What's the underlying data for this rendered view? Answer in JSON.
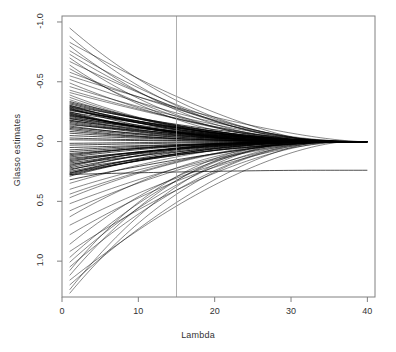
{
  "chart_data": {
    "type": "line",
    "title": "",
    "subtitle": "",
    "xlabel": "Lambda",
    "ylabel": "Glasso estimates",
    "xlim": [
      0,
      41
    ],
    "ylim": [
      1.3,
      -1.05
    ],
    "y_axis_inverted": true,
    "grid": false,
    "legend": null,
    "xticks": [
      {
        "value": 0,
        "label": "0"
      },
      {
        "value": 10,
        "label": "10"
      },
      {
        "value": 20,
        "label": "20"
      },
      {
        "value": 30,
        "label": "30"
      },
      {
        "value": 40,
        "label": "40"
      }
    ],
    "yticks": [
      {
        "value": -1.0,
        "label": "-1.0"
      },
      {
        "value": -0.5,
        "label": "-0.5"
      },
      {
        "value": 0.0,
        "label": "0.0"
      },
      {
        "value": 0.5,
        "label": "0.5"
      },
      {
        "value": 1.0,
        "label": "1.0"
      }
    ],
    "annotations": [
      {
        "name": "selected-lambda-line",
        "type": "vline",
        "x": 15
      }
    ],
    "series_count": 108,
    "x_start": 1,
    "x_end": 40,
    "converge_x": 36,
    "series": [
      {
        "name": "path-001",
        "y0": -0.95,
        "yend": 0.0
      },
      {
        "name": "path-002",
        "y0": -0.88,
        "yend": 0.0
      },
      {
        "name": "path-003",
        "y0": -0.83,
        "yend": 0.0
      },
      {
        "name": "path-004",
        "y0": -0.8,
        "yend": 0.0
      },
      {
        "name": "path-005",
        "y0": -0.76,
        "yend": 0.0
      },
      {
        "name": "path-006",
        "y0": -0.73,
        "yend": 0.0
      },
      {
        "name": "path-007",
        "y0": -0.7,
        "yend": 0.0
      },
      {
        "name": "path-008",
        "y0": -0.67,
        "yend": 0.0
      },
      {
        "name": "path-009",
        "y0": -0.64,
        "yend": 0.0
      },
      {
        "name": "path-010",
        "y0": -0.61,
        "yend": 0.0
      },
      {
        "name": "path-011",
        "y0": -0.58,
        "yend": 0.0
      },
      {
        "name": "path-012",
        "y0": -0.55,
        "yend": 0.0
      },
      {
        "name": "path-013",
        "y0": -0.52,
        "yend": 0.0
      },
      {
        "name": "path-014",
        "y0": -0.49,
        "yend": 0.0
      },
      {
        "name": "path-015",
        "y0": -0.46,
        "yend": 0.0
      },
      {
        "name": "path-016",
        "y0": -0.43,
        "yend": 0.0
      },
      {
        "name": "path-017",
        "y0": -0.41,
        "yend": 0.0
      },
      {
        "name": "path-018",
        "y0": -0.39,
        "yend": 0.0
      },
      {
        "name": "path-019",
        "y0": -0.37,
        "yend": 0.0
      },
      {
        "name": "path-020",
        "y0": -0.35,
        "yend": 0.0
      },
      {
        "name": "path-021",
        "y0": -0.335,
        "yend": 0.0
      },
      {
        "name": "path-022",
        "y0": -0.325,
        "yend": 0.0
      },
      {
        "name": "path-023",
        "y0": -0.315,
        "yend": 0.0
      },
      {
        "name": "path-024",
        "y0": -0.305,
        "yend": 0.0
      },
      {
        "name": "path-025",
        "y0": -0.3,
        "yend": 0.0
      },
      {
        "name": "path-026",
        "y0": -0.295,
        "yend": 0.0
      },
      {
        "name": "path-027",
        "y0": -0.29,
        "yend": 0.0
      },
      {
        "name": "path-028",
        "y0": -0.285,
        "yend": 0.0
      },
      {
        "name": "path-029",
        "y0": -0.28,
        "yend": 0.0
      },
      {
        "name": "path-030",
        "y0": -0.275,
        "yend": 0.0
      },
      {
        "name": "path-031",
        "y0": -0.27,
        "yend": 0.0
      },
      {
        "name": "path-032",
        "y0": -0.265,
        "yend": 0.0
      },
      {
        "name": "path-033",
        "y0": -0.26,
        "yend": 0.0
      },
      {
        "name": "path-034",
        "y0": -0.25,
        "yend": 0.0
      },
      {
        "name": "path-035",
        "y0": -0.245,
        "yend": 0.0
      },
      {
        "name": "path-036",
        "y0": -0.24,
        "yend": 0.0
      },
      {
        "name": "path-037",
        "y0": -0.235,
        "yend": 0.0
      },
      {
        "name": "path-038",
        "y0": -0.23,
        "yend": 0.0
      },
      {
        "name": "path-039",
        "y0": -0.225,
        "yend": 0.0
      },
      {
        "name": "path-040",
        "y0": -0.22,
        "yend": 0.0
      },
      {
        "name": "path-041",
        "y0": -0.215,
        "yend": 0.0
      },
      {
        "name": "path-042",
        "y0": -0.21,
        "yend": 0.0
      },
      {
        "name": "path-043",
        "y0": -0.2,
        "yend": 0.0
      },
      {
        "name": "path-044",
        "y0": -0.195,
        "yend": 0.0
      },
      {
        "name": "path-045",
        "y0": -0.19,
        "yend": 0.0
      },
      {
        "name": "path-046",
        "y0": -0.18,
        "yend": 0.0
      },
      {
        "name": "path-047",
        "y0": -0.175,
        "yend": 0.0
      },
      {
        "name": "path-048",
        "y0": -0.17,
        "yend": 0.0
      },
      {
        "name": "path-049",
        "y0": -0.16,
        "yend": 0.0
      },
      {
        "name": "path-050",
        "y0": -0.15,
        "yend": 0.0
      },
      {
        "name": "path-051",
        "y0": -0.14,
        "yend": 0.0
      },
      {
        "name": "path-052",
        "y0": -0.13,
        "yend": 0.0
      },
      {
        "name": "path-053",
        "y0": -0.12,
        "yend": 0.0
      },
      {
        "name": "path-054",
        "y0": -0.11,
        "yend": 0.0
      },
      {
        "name": "path-055",
        "y0": -0.1,
        "yend": 0.0
      },
      {
        "name": "path-056",
        "y0": -0.085,
        "yend": 0.0
      },
      {
        "name": "path-057",
        "y0": -0.07,
        "yend": 0.0
      },
      {
        "name": "path-058",
        "y0": -0.05,
        "yend": 0.0
      },
      {
        "name": "path-059",
        "y0": -0.03,
        "yend": 0.0
      },
      {
        "name": "path-060",
        "y0": -0.015,
        "yend": 0.0
      },
      {
        "name": "path-061",
        "y0": 0.015,
        "yend": 0.0
      },
      {
        "name": "path-062",
        "y0": 0.03,
        "yend": 0.0
      },
      {
        "name": "path-063",
        "y0": 0.05,
        "yend": 0.0
      },
      {
        "name": "path-064",
        "y0": 0.07,
        "yend": 0.0
      },
      {
        "name": "path-065",
        "y0": 0.085,
        "yend": 0.0
      },
      {
        "name": "path-066",
        "y0": 0.1,
        "yend": 0.0
      },
      {
        "name": "path-067",
        "y0": 0.11,
        "yend": 0.0
      },
      {
        "name": "path-068",
        "y0": 0.12,
        "yend": 0.0
      },
      {
        "name": "path-069",
        "y0": 0.13,
        "yend": 0.0
      },
      {
        "name": "path-070",
        "y0": 0.14,
        "yend": 0.0
      },
      {
        "name": "path-071",
        "y0": 0.15,
        "yend": 0.0
      },
      {
        "name": "path-072",
        "y0": 0.16,
        "yend": 0.0
      },
      {
        "name": "path-073",
        "y0": 0.17,
        "yend": 0.0
      },
      {
        "name": "path-074",
        "y0": 0.18,
        "yend": 0.0
      },
      {
        "name": "path-075",
        "y0": 0.19,
        "yend": 0.0
      },
      {
        "name": "path-076",
        "y0": 0.2,
        "yend": 0.0
      },
      {
        "name": "path-077",
        "y0": 0.21,
        "yend": 0.0
      },
      {
        "name": "path-078",
        "y0": 0.22,
        "yend": 0.0
      },
      {
        "name": "path-079",
        "y0": 0.23,
        "yend": 0.0
      },
      {
        "name": "path-080",
        "y0": 0.24,
        "yend": 0.0
      },
      {
        "name": "path-081",
        "y0": 0.25,
        "yend": 0.0
      },
      {
        "name": "path-082",
        "y0": 0.26,
        "yend": 0.0
      },
      {
        "name": "path-083",
        "y0": 0.265,
        "yend": 0.0
      },
      {
        "name": "path-084",
        "y0": 0.27,
        "yend": 0.0
      },
      {
        "name": "path-085",
        "y0": 0.275,
        "yend": 0.24
      },
      {
        "name": "path-086",
        "y0": 0.28,
        "yend": 0.0
      },
      {
        "name": "path-087",
        "y0": 0.29,
        "yend": 0.0
      },
      {
        "name": "path-088",
        "y0": 0.32,
        "yend": 0.0
      },
      {
        "name": "path-089",
        "y0": 0.35,
        "yend": 0.0
      },
      {
        "name": "path-090",
        "y0": 0.4,
        "yend": 0.0
      },
      {
        "name": "path-091",
        "y0": 0.44,
        "yend": 0.0
      },
      {
        "name": "path-092",
        "y0": 0.47,
        "yend": 0.0
      },
      {
        "name": "path-093",
        "y0": 0.52,
        "yend": 0.0
      },
      {
        "name": "path-094",
        "y0": 0.58,
        "yend": 0.0
      },
      {
        "name": "path-095",
        "y0": 0.63,
        "yend": 0.0
      },
      {
        "name": "path-096",
        "y0": 0.7,
        "yend": 0.0
      },
      {
        "name": "path-097",
        "y0": 0.78,
        "yend": 0.0
      },
      {
        "name": "path-098",
        "y0": 0.86,
        "yend": 0.0
      },
      {
        "name": "path-099",
        "y0": 0.92,
        "yend": 0.0
      },
      {
        "name": "path-100",
        "y0": 0.97,
        "yend": 0.0
      },
      {
        "name": "path-101",
        "y0": 1.01,
        "yend": 0.0
      },
      {
        "name": "path-102",
        "y0": 1.05,
        "yend": 0.0
      },
      {
        "name": "path-103",
        "y0": 1.08,
        "yend": 0.0
      },
      {
        "name": "path-104",
        "y0": 1.12,
        "yend": 0.0
      },
      {
        "name": "path-105",
        "y0": 1.16,
        "yend": 0.0
      },
      {
        "name": "path-106",
        "y0": 1.2,
        "yend": 0.0
      },
      {
        "name": "path-107",
        "y0": 1.24,
        "yend": 0.0
      },
      {
        "name": "path-108",
        "y0": 1.27,
        "yend": 0.0
      }
    ],
    "colors": {
      "line": "#000000",
      "axis": "#808080",
      "text": "#333333",
      "vline": "#9a9a9a",
      "background": "#ffffff"
    }
  }
}
